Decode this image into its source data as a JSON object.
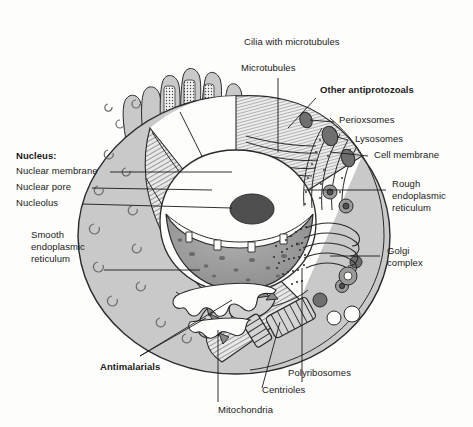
{
  "figure": {
    "background_color": "#fdfdfb",
    "ink_color": "#1a1a1a",
    "cytoplasm_color": "#c9c9c9",
    "organelle_dark_color": "#6f6f6f",
    "nucleolus_color": "#4f4f4f",
    "nucleoplasm_color": "#9a9a9a"
  },
  "labels": {
    "cilia": "Cilia with microtubules",
    "microtubules": "Microtubules",
    "other_antiprotozoals": "Other antiprotozoals",
    "perioxsomes": "Perioxsomes",
    "lysosomes": "Lysosomes",
    "cell_membrane": "Cell membrane",
    "rough_er_line1": "Rough",
    "rough_er_line2": "endoplasmic",
    "rough_er_line3": "reticulum",
    "golgi_line1": "Golgi",
    "golgi_line2": "complex",
    "nucleus_heading": "Nucleus:",
    "nuclear_membrane": "Nuclear membrane",
    "nuclear_pore": "Nuclear pore",
    "nucleolus": "Nucleolus",
    "smooth_er_line1": "Smooth",
    "smooth_er_line2": "endoplasmic",
    "smooth_er_line3": "reticulum",
    "antimalarials": "Antimalarials",
    "polyribosomes": "Polyribosomes",
    "centrioles": "Centrioles",
    "mitochondria": "Mitochondria"
  },
  "callouts": [
    {
      "name": "cilia-with-microtubules",
      "text": "Cilia with microtubules",
      "bold": false,
      "side": "top"
    },
    {
      "name": "microtubules",
      "text": "Microtubules",
      "bold": false,
      "side": "top"
    },
    {
      "name": "other-antiprotozoals",
      "text": "Other antiprotozoals",
      "bold": true,
      "side": "top-right"
    },
    {
      "name": "perioxsomes",
      "text": "Perioxsomes",
      "bold": false,
      "side": "right"
    },
    {
      "name": "lysosomes",
      "text": "Lysosomes",
      "bold": false,
      "side": "right"
    },
    {
      "name": "cell-membrane",
      "text": "Cell membrane",
      "bold": false,
      "side": "right"
    },
    {
      "name": "rough-endoplasmic-reticulum",
      "text": "Rough endoplasmic reticulum",
      "bold": false,
      "side": "right"
    },
    {
      "name": "golgi-complex",
      "text": "Golgi complex",
      "bold": false,
      "side": "right"
    },
    {
      "name": "nucleus",
      "text": "Nucleus:",
      "bold": true,
      "side": "left"
    },
    {
      "name": "nuclear-membrane",
      "text": "Nuclear membrane",
      "bold": false,
      "side": "left"
    },
    {
      "name": "nuclear-pore",
      "text": "Nuclear pore",
      "bold": false,
      "side": "left"
    },
    {
      "name": "nucleolus",
      "text": "Nucleolus",
      "bold": false,
      "side": "left"
    },
    {
      "name": "smooth-endoplasmic-reticulum",
      "text": "Smooth endoplasmic reticulum",
      "bold": false,
      "side": "left"
    },
    {
      "name": "antimalarials",
      "text": "Antimalarials",
      "bold": true,
      "side": "bottom-left"
    },
    {
      "name": "polyribosomes",
      "text": "Polyribosomes",
      "bold": false,
      "side": "bottom-right"
    },
    {
      "name": "centrioles",
      "text": "Centrioles",
      "bold": false,
      "side": "bottom"
    },
    {
      "name": "mitochondria",
      "text": "Mitochondria",
      "bold": false,
      "side": "bottom"
    }
  ]
}
